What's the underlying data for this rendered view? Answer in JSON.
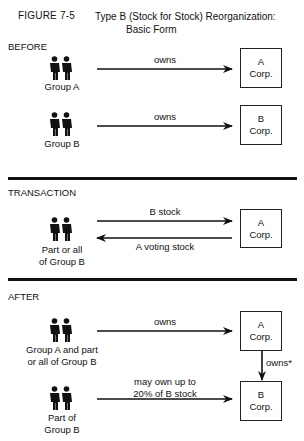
{
  "figure": {
    "number": "FIGURE 7-5",
    "title_line1": "Type B (Stock for Stock) Reorganization:",
    "title_line2": "Basic Form"
  },
  "sections": {
    "before": {
      "heading": "BEFORE",
      "rows": [
        {
          "group_label": "Group A",
          "arrow_label": "owns",
          "box_line1": "A",
          "box_line2": "Corp."
        },
        {
          "group_label": "Group B",
          "arrow_label": "owns",
          "box_line1": "B",
          "box_line2": "Corp."
        }
      ]
    },
    "transaction": {
      "heading": "TRANSACTION",
      "group_label_line1": "Part or all",
      "group_label_line2": "of Group B",
      "arrow_right_label": "B stock",
      "arrow_left_label": "A voting stock",
      "box_line1": "A",
      "box_line2": "Corp."
    },
    "after": {
      "heading": "AFTER",
      "row1": {
        "group_label_line1": "Group A and part",
        "group_label_line2": "or all of Group B",
        "arrow_label": "owns",
        "box_line1": "A",
        "box_line2": "Corp."
      },
      "vertical_arrow_label": "owns*",
      "row2": {
        "group_label_line1": "Part of",
        "group_label_line2": "Group B",
        "arrow_label_line1": "may own up to",
        "arrow_label_line2": "20% of B stock",
        "box_line1": "B",
        "box_line2": "Corp."
      }
    }
  },
  "icons": {
    "people": "two-people-icon"
  },
  "colors": {
    "ink": "#111111",
    "background": "#ffffff"
  }
}
